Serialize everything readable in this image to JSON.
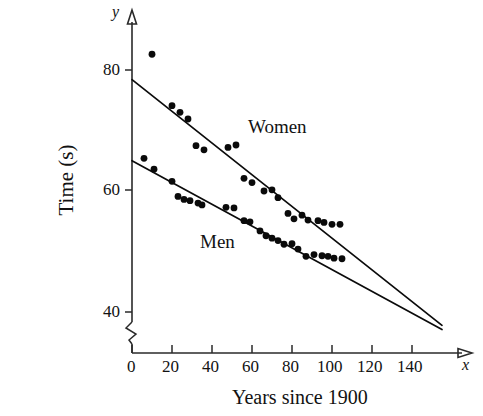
{
  "chart_data": {
    "type": "scatter",
    "title": "",
    "xlabel": "Years since 1900",
    "ylabel": "Time (s)",
    "x_axis_name": "x",
    "y_axis_name": "y",
    "xlim": [
      0,
      160
    ],
    "ylim": [
      36,
      86
    ],
    "y_axis_break": true,
    "grid": false,
    "legend_position": "inline-annotations",
    "xticks": [
      0,
      20,
      40,
      60,
      80,
      100,
      120,
      140
    ],
    "xtick_labels": [
      "0",
      "20",
      "40",
      "60",
      "80",
      "100",
      "120",
      "140"
    ],
    "yticks": [
      40,
      60,
      80
    ],
    "ytick_labels": [
      "40",
      "60",
      "80"
    ],
    "annotations": [
      {
        "text": "Women",
        "x": 72,
        "y": 69.5
      },
      {
        "text": "Men",
        "x": 42,
        "y": 53.0
      }
    ],
    "series": [
      {
        "name": "Women",
        "label": "Women",
        "marker": "filled-circle",
        "color": "#0a0a0a",
        "trendline": {
          "name": "women-trendline",
          "x0": 0,
          "y0": 78.4,
          "x1": 155,
          "y1": 37.8
        },
        "points": [
          {
            "x": 10,
            "y": 82.6
          },
          {
            "x": 20,
            "y": 74.1
          },
          {
            "x": 24,
            "y": 73.0
          },
          {
            "x": 28,
            "y": 71.9
          },
          {
            "x": 32,
            "y": 67.5
          },
          {
            "x": 36,
            "y": 66.8
          },
          {
            "x": 48,
            "y": 67.2
          },
          {
            "x": 52,
            "y": 67.6
          },
          {
            "x": 56,
            "y": 62.1
          },
          {
            "x": 60,
            "y": 61.4
          },
          {
            "x": 66,
            "y": 60.0
          },
          {
            "x": 70,
            "y": 60.2
          },
          {
            "x": 73,
            "y": 58.9
          },
          {
            "x": 78,
            "y": 56.3
          },
          {
            "x": 81,
            "y": 55.4
          },
          {
            "x": 85,
            "y": 56.0
          },
          {
            "x": 88,
            "y": 55.2
          },
          {
            "x": 93,
            "y": 55.1
          },
          {
            "x": 96,
            "y": 54.8
          },
          {
            "x": 100,
            "y": 54.5
          },
          {
            "x": 104,
            "y": 54.5
          }
        ]
      },
      {
        "name": "Men",
        "label": "Men",
        "marker": "filled-circle",
        "color": "#0a0a0a",
        "trendline": {
          "name": "men-trendline",
          "x0": 0,
          "y0": 65.0,
          "x1": 155,
          "y1": 37.1
        },
        "points": [
          {
            "x": 6,
            "y": 65.4
          },
          {
            "x": 11,
            "y": 63.6
          },
          {
            "x": 20,
            "y": 61.6
          },
          {
            "x": 23,
            "y": 59.1
          },
          {
            "x": 26,
            "y": 58.6
          },
          {
            "x": 29,
            "y": 58.4
          },
          {
            "x": 33,
            "y": 58.0
          },
          {
            "x": 35,
            "y": 57.7
          },
          {
            "x": 47,
            "y": 57.3
          },
          {
            "x": 51,
            "y": 57.2
          },
          {
            "x": 56,
            "y": 55.1
          },
          {
            "x": 59,
            "y": 54.9
          },
          {
            "x": 64,
            "y": 53.4
          },
          {
            "x": 67,
            "y": 52.6
          },
          {
            "x": 70,
            "y": 52.2
          },
          {
            "x": 73,
            "y": 51.8
          },
          {
            "x": 76,
            "y": 51.2
          },
          {
            "x": 80,
            "y": 51.3
          },
          {
            "x": 83,
            "y": 50.4
          },
          {
            "x": 87,
            "y": 49.2
          },
          {
            "x": 91,
            "y": 49.5
          },
          {
            "x": 95,
            "y": 49.3
          },
          {
            "x": 98,
            "y": 49.2
          },
          {
            "x": 101,
            "y": 48.9
          },
          {
            "x": 105,
            "y": 48.8
          }
        ]
      }
    ]
  }
}
